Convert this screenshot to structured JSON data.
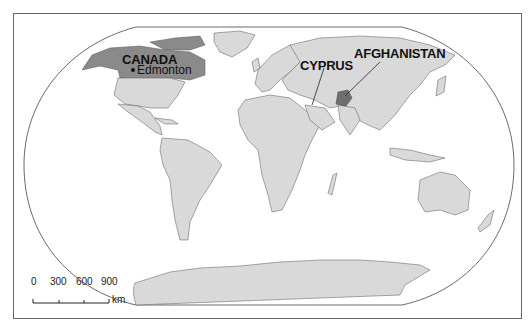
{
  "map": {
    "projection": "world-outline",
    "colors": {
      "land": "#d9d9d9",
      "highlight": "#8a8a8a",
      "border": "#555555",
      "ocean": "#ffffff"
    },
    "labels": {
      "canada": "CANADA",
      "edmonton": "Edmonton",
      "cyprus": "CYPRUS",
      "afghanistan": "AFGHANISTAN"
    },
    "highlighted_countries": [
      "CANADA",
      "AFGHANISTAN"
    ],
    "scale_bar": {
      "ticks": [
        "0",
        "300",
        "600",
        "900"
      ],
      "unit": "km"
    }
  }
}
